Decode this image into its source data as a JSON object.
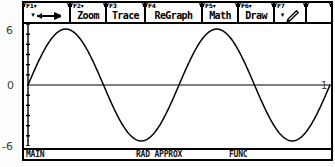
{
  "device": {
    "name": "TI-89 Graphing Calculator",
    "screen": "graph-screen"
  },
  "toolbar": {
    "buttons": [
      {
        "fkey": "F1",
        "fkey_arrow": "▾",
        "label": "",
        "icon": "tools-pointer-icon",
        "has_menu_arrow": true,
        "width": 47
      },
      {
        "fkey": "F2",
        "fkey_arrow": "▾",
        "label": "Zoom",
        "icon": "",
        "has_menu_arrow": false,
        "width": 36
      },
      {
        "fkey": "F3",
        "fkey_arrow": "",
        "label": "Trace",
        "icon": "",
        "has_menu_arrow": false,
        "width": 39
      },
      {
        "fkey": "F4",
        "fkey_arrow": "",
        "label": "ReGraph",
        "icon": "",
        "has_menu_arrow": false,
        "width": 57
      },
      {
        "fkey": "F5",
        "fkey_arrow": "▾",
        "label": "Math",
        "icon": "",
        "has_menu_arrow": false,
        "width": 36
      },
      {
        "fkey": "F6",
        "fkey_arrow": "▾",
        "label": "Draw",
        "icon": "",
        "has_menu_arrow": false,
        "width": 36
      },
      {
        "fkey": "F7",
        "fkey_arrow": "",
        "label": "",
        "icon": "pencil-icon",
        "has_menu_arrow": true,
        "width": 32
      },
      {
        "fkey": "",
        "fkey_arrow": "",
        "label": "",
        "icon": "",
        "has_menu_arrow": false,
        "width": 24
      }
    ]
  },
  "status": {
    "folder": "MAIN",
    "mode": "RAD APPROX",
    "graph_mode": "FUNC"
  },
  "axis_labels": {
    "y_max": "6",
    "y_zero": "0",
    "y_min": "-6",
    "x_right": "1"
  },
  "chart_data": {
    "type": "line",
    "title": "",
    "xlabel": "",
    "ylabel": "",
    "function": "y = 5.5 sin(x)",
    "xlim": [
      0,
      12.566
    ],
    "ylim": [
      -6,
      6
    ],
    "grid": false,
    "legend": null,
    "axes": {
      "x_axis_visible": true,
      "y_axis_visible": true,
      "y_tick_step": 1,
      "x_tick_step": null
    },
    "x": [
      0.0,
      0.628,
      1.257,
      1.885,
      2.513,
      3.142,
      3.77,
      4.398,
      5.027,
      5.655,
      6.283,
      6.912,
      7.54,
      8.168,
      8.796,
      9.425,
      10.053,
      10.681,
      11.31,
      11.938,
      12.566
    ],
    "values": [
      0.0,
      3.23,
      5.23,
      5.23,
      3.23,
      0.0,
      -3.23,
      -5.23,
      -5.23,
      -3.23,
      0.0,
      3.23,
      5.23,
      5.23,
      3.23,
      0.0,
      -3.23,
      -5.23,
      -5.23,
      -3.23,
      0.0
    ],
    "note": "One full sine period drawn across the plot window; peak near x=1.6, trough near x=4.8"
  }
}
